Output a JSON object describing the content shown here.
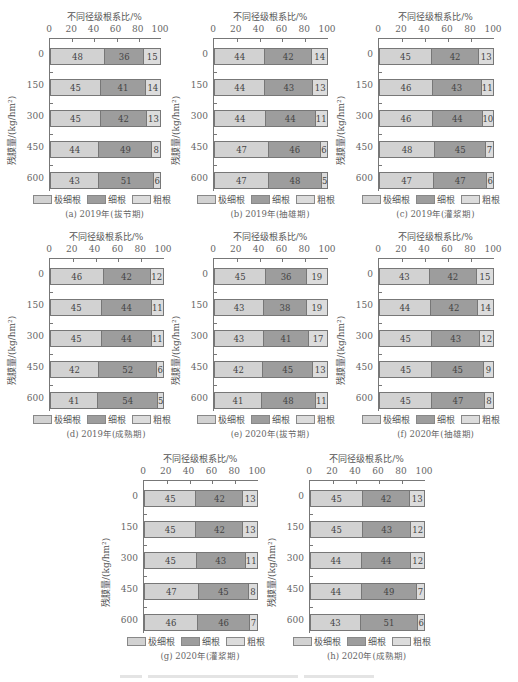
{
  "colors": {
    "ultrafine": "#d2d2d2",
    "fine": "#9d9d9d",
    "coarse": "#dcdcdc"
  },
  "legend": {
    "ultrafine": "极细根",
    "fine": "细根",
    "coarse": "粗根"
  },
  "shared": {
    "x_title": "不同径级根系比/%",
    "x_ticks": [
      "0",
      "20",
      "40",
      "60",
      "80",
      "100"
    ],
    "y_title": "残膜量/(kg/hm²)",
    "categories": [
      "0",
      "150",
      "300",
      "450",
      "600"
    ]
  },
  "chart_data": [
    {
      "type": "bar",
      "stacked": true,
      "orientation": "horizontal",
      "title": "(a) 2019年(拔节期)",
      "xlabel": "不同径级根系比/%",
      "ylabel": "残膜量/(kg/hm²)",
      "xlim": [
        0,
        100
      ],
      "categories": [
        "0",
        "150",
        "300",
        "450",
        "600"
      ],
      "series": [
        {
          "name": "极细根",
          "values": [
            48,
            45,
            45,
            44,
            43
          ]
        },
        {
          "name": "细根",
          "values": [
            36,
            41,
            42,
            49,
            51
          ]
        },
        {
          "name": "粗根",
          "values": [
            15,
            14,
            13,
            8,
            6
          ]
        }
      ]
    },
    {
      "type": "bar",
      "stacked": true,
      "orientation": "horizontal",
      "title": "(b) 2019年(抽雄期)",
      "xlabel": "不同径级根系比/%",
      "ylabel": "残膜量/(kg/hm²)",
      "xlim": [
        0,
        100
      ],
      "categories": [
        "0",
        "150",
        "300",
        "450",
        "600"
      ],
      "series": [
        {
          "name": "极细根",
          "values": [
            44,
            44,
            44,
            47,
            47
          ]
        },
        {
          "name": "细根",
          "values": [
            42,
            43,
            44,
            46,
            48
          ]
        },
        {
          "name": "粗根",
          "values": [
            14,
            13,
            11,
            6,
            5
          ]
        }
      ]
    },
    {
      "type": "bar",
      "stacked": true,
      "orientation": "horizontal",
      "title": "(c) 2019年(灌浆期)",
      "xlabel": "不同径级根系比/%",
      "ylabel": "残膜量/(kg/hm²)",
      "xlim": [
        0,
        100
      ],
      "categories": [
        "0",
        "150",
        "300",
        "450",
        "600"
      ],
      "series": [
        {
          "name": "极细根",
          "values": [
            45,
            46,
            46,
            48,
            47
          ]
        },
        {
          "name": "细根",
          "values": [
            42,
            43,
            44,
            45,
            47
          ]
        },
        {
          "name": "粗根",
          "values": [
            13,
            11,
            10,
            7,
            6
          ]
        }
      ]
    },
    {
      "type": "bar",
      "stacked": true,
      "orientation": "horizontal",
      "title": "(d) 2019年(成熟期)",
      "xlabel": "不同径级根系比/%",
      "ylabel": "残膜量/(kg/hm²)",
      "xlim": [
        0,
        100
      ],
      "categories": [
        "0",
        "150",
        "300",
        "450",
        "600"
      ],
      "series": [
        {
          "name": "极细根",
          "values": [
            46,
            45,
            45,
            42,
            41
          ]
        },
        {
          "name": "细根",
          "values": [
            42,
            44,
            44,
            52,
            54
          ]
        },
        {
          "name": "粗根",
          "values": [
            12,
            11,
            11,
            6,
            5
          ]
        }
      ]
    },
    {
      "type": "bar",
      "stacked": true,
      "orientation": "horizontal",
      "title": "(e) 2020年(拔节期)",
      "xlabel": "不同径级根系比/%",
      "ylabel": "残膜量/(kg/hm²)",
      "xlim": [
        0,
        100
      ],
      "categories": [
        "0",
        "150",
        "300",
        "450",
        "600"
      ],
      "series": [
        {
          "name": "极细根",
          "values": [
            45,
            43,
            43,
            42,
            41
          ]
        },
        {
          "name": "细根",
          "values": [
            36,
            38,
            41,
            45,
            48
          ]
        },
        {
          "name": "粗根",
          "values": [
            19,
            19,
            17,
            13,
            11
          ]
        }
      ]
    },
    {
      "type": "bar",
      "stacked": true,
      "orientation": "horizontal",
      "title": "(f) 2020年(抽雄期)",
      "xlabel": "不同径级根系比/%",
      "ylabel": "残膜量/(kg/hm²)",
      "xlim": [
        0,
        100
      ],
      "categories": [
        "0",
        "150",
        "300",
        "450",
        "600"
      ],
      "series": [
        {
          "name": "极细根",
          "values": [
            43,
            44,
            45,
            45,
            45
          ]
        },
        {
          "name": "细根",
          "values": [
            42,
            42,
            43,
            45,
            47
          ]
        },
        {
          "name": "粗根",
          "values": [
            15,
            14,
            12,
            9,
            8
          ]
        }
      ]
    },
    {
      "type": "bar",
      "stacked": true,
      "orientation": "horizontal",
      "title": "(g) 2020年(灌浆期)",
      "xlabel": "不同径级根系比/%",
      "ylabel": "残膜量/(kg/hm²)",
      "xlim": [
        0,
        100
      ],
      "categories": [
        "0",
        "150",
        "300",
        "450",
        "600"
      ],
      "series": [
        {
          "name": "极细根",
          "values": [
            45,
            45,
            45,
            47,
            46
          ]
        },
        {
          "name": "细根",
          "values": [
            42,
            42,
            43,
            45,
            46
          ]
        },
        {
          "name": "粗根",
          "values": [
            13,
            13,
            11,
            8,
            7
          ]
        }
      ]
    },
    {
      "type": "bar",
      "stacked": true,
      "orientation": "horizontal",
      "title": "(h) 2020年(成熟期)",
      "xlabel": "不同径级根系比/%",
      "ylabel": "残膜量/(kg/hm²)",
      "xlim": [
        0,
        100
      ],
      "categories": [
        "0",
        "150",
        "300",
        "450",
        "600"
      ],
      "series": [
        {
          "name": "极细根",
          "values": [
            45,
            45,
            44,
            44,
            43
          ]
        },
        {
          "name": "细根",
          "values": [
            42,
            43,
            44,
            49,
            51
          ]
        },
        {
          "name": "粗根",
          "values": [
            13,
            12,
            12,
            7,
            6
          ]
        }
      ]
    }
  ]
}
